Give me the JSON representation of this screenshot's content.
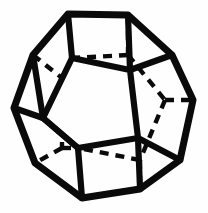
{
  "figure": {
    "shape_name": "dodecahedron",
    "background_color": "#fefefe",
    "stroke_color": "#0a0a0a",
    "canvas": {
      "width": 208,
      "height": 213
    },
    "visible_edge_style": "solid",
    "hidden_edge_style": "dashed",
    "visible_stroke_width": 6.2,
    "hidden_stroke_width": 4.4,
    "hidden_dash_pattern": "9 7",
    "outline_points": "68,14 128,15 172,55 193,100 180,160 140,189 82,198 35,163 14,108 33,55",
    "front_face_points": "72,58 130,70 138,138 78,148 43,118",
    "visible_edges": [
      "68,14 72,58",
      "128,15 130,70",
      "172,55 130,70",
      "33,55 43,118",
      "14,108 43,118",
      "43,118 78,148",
      "78,148 82,198",
      "138,138 180,160",
      "138,138 140,189",
      "72,58 130,70",
      "130,70 138,138",
      "138,138 78,148",
      "78,148 43,118",
      "43,118 72,58",
      "172,55 193,100",
      "193,100 180,160",
      "180,160 140,189",
      "140,189 82,198",
      "82,198 35,163",
      "35,163 14,108",
      "14,108 33,55",
      "33,55 68,14",
      "68,14 128,15",
      "128,15 172,55"
    ],
    "hidden_edges": [
      "128,15 128,55",
      "128,55 72,58",
      "128,55 165,100",
      "165,100 193,100",
      "165,100 140,160",
      "140,160 140,189",
      "140,160 78,148",
      "33,55 62,78",
      "62,78 72,58",
      "62,78 62,148",
      "62,148 35,163",
      "62,148 78,148"
    ]
  }
}
